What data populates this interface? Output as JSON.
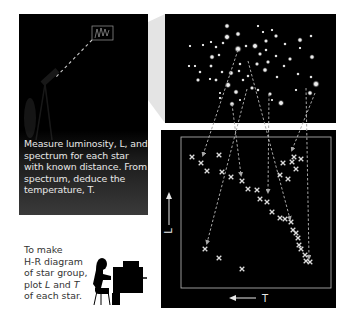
{
  "sky_panel": {
    "caption": "Measure luminosity, L, and spectrum for each star with known distance. From spectrum, deduce the temperature, T.",
    "telescope_target_box": {
      "x": 95,
      "y": 27,
      "w": 19,
      "h": 13
    }
  },
  "instruction": {
    "line1": "To make",
    "line2": "H-R diagram",
    "line3": "of star group,",
    "line4_a": "plot ",
    "line4_L": "L",
    "line4_b": " and ",
    "line4_T": "T",
    "line5": "of each star."
  },
  "hr_diagram": {
    "y_axis_label": "L",
    "x_axis_label": "T",
    "x_axis_direction": "arrow pointing left (temperature increases to the left)",
    "y_axis_direction": "arrow pointing up (luminosity increases upward)"
  },
  "colors": {
    "background": "#ffffff",
    "panel": "#000000",
    "star": "#e6e6e6",
    "marker": "#dcdcdc",
    "arrow": "#a8a8a8",
    "frame": "#bdbdbd",
    "wedge": "#e4e4e4"
  },
  "chart_data": {
    "type": "scatter",
    "title": "H-R diagram of star group",
    "xlabel": "T",
    "ylabel": "L",
    "x_reversed": true,
    "grid": false,
    "points_px": [
      [
        192,
        157
      ],
      [
        201,
        163
      ],
      [
        207,
        171
      ],
      [
        219,
        155
      ],
      [
        222,
        172
      ],
      [
        231,
        177
      ],
      [
        242,
        181
      ],
      [
        248,
        189
      ],
      [
        257,
        190
      ],
      [
        260,
        199
      ],
      [
        267,
        202
      ],
      [
        272,
        212
      ],
      [
        280,
        218
      ],
      [
        285,
        219
      ],
      [
        291,
        222
      ],
      [
        293,
        230
      ],
      [
        296,
        233
      ],
      [
        298,
        238
      ],
      [
        299,
        245
      ],
      [
        301,
        249
      ],
      [
        305,
        255
      ],
      [
        306,
        261
      ],
      [
        310,
        262
      ],
      [
        283,
        163
      ],
      [
        280,
        175
      ],
      [
        288,
        179
      ],
      [
        294,
        157
      ],
      [
        292,
        162
      ],
      [
        296,
        169
      ],
      [
        301,
        159
      ],
      [
        205,
        249
      ],
      [
        219,
        258
      ],
      [
        242,
        269
      ]
    ],
    "groups": {
      "main_sequence": 23,
      "giants": 7,
      "white_dwarfs": 3
    }
  }
}
